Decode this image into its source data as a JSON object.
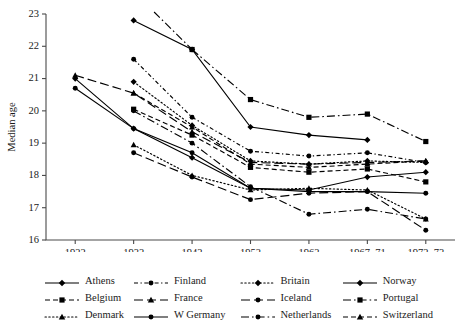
{
  "chart_data": {
    "type": "line",
    "title": "",
    "xlabel": "Birth cohort",
    "ylabel": "Median age",
    "categories": [
      "1922",
      "1932",
      "1942",
      "1952",
      "1962",
      "1967–71",
      "1972–73"
    ],
    "ylim": [
      16,
      23
    ],
    "yticks": [
      16,
      17,
      18,
      19,
      20,
      21,
      22,
      23
    ],
    "grid": false,
    "legend_position": "below",
    "legend_columns": 4,
    "series": [
      {
        "name": "Athens",
        "marker": "diamond",
        "dash": "solid",
        "values": [
          null,
          22.8,
          21.9,
          19.5,
          19.25,
          19.1,
          null
        ]
      },
      {
        "name": "Finland",
        "marker": "circle",
        "dash": "dash-dot-fine",
        "values": [
          null,
          21.6,
          19.8,
          18.75,
          18.6,
          18.7,
          18.4
        ]
      },
      {
        "name": "Britain",
        "marker": "diamond",
        "dash": "dotted",
        "values": [
          null,
          20.9,
          19.55,
          18.45,
          18.35,
          18.45,
          18.4
        ]
      },
      {
        "name": "Norway",
        "marker": "diamond",
        "dash": "solid",
        "values": [
          21.0,
          19.45,
          18.55,
          17.6,
          17.55,
          17.95,
          18.1
        ]
      },
      {
        "name": "Belgium",
        "marker": "square",
        "dash": "dashed",
        "values": [
          null,
          20.05,
          19.25,
          18.25,
          18.1,
          18.2,
          17.8
        ]
      },
      {
        "name": "France",
        "marker": "triangle",
        "dash": "long-dash",
        "values": [
          21.1,
          20.55,
          19.35,
          18.4,
          18.35,
          18.4,
          18.45
        ]
      },
      {
        "name": "Iceland",
        "marker": "circle",
        "dash": "long-dash",
        "values": [
          null,
          18.7,
          17.95,
          17.25,
          17.45,
          17.5,
          16.3
        ]
      },
      {
        "name": "Portugal",
        "marker": "square",
        "dash": "dash-dot",
        "values": [
          null,
          null,
          21.9,
          20.35,
          19.8,
          19.9,
          19.05
        ]
      },
      {
        "name": "Denmark",
        "marker": "triangle",
        "dash": "dotted",
        "values": [
          null,
          18.95,
          18.0,
          17.55,
          17.6,
          17.55,
          16.65
        ]
      },
      {
        "name": "W Germany",
        "marker": "circle",
        "dash": "solid",
        "values": [
          20.7,
          19.45,
          18.7,
          17.6,
          17.5,
          17.5,
          17.45
        ]
      },
      {
        "name": "Netherlands",
        "marker": "circle",
        "dash": "dash-dot",
        "values": [
          null,
          20.0,
          19.0,
          17.65,
          16.8,
          16.95,
          16.65
        ]
      },
      {
        "name": "Switzerland",
        "marker": "triangle",
        "dash": "dashed",
        "values": [
          null,
          20.55,
          19.5,
          18.35,
          18.25,
          18.35,
          18.45
        ]
      }
    ]
  },
  "legend": {
    "rows": [
      [
        {
          "label": "Athens",
          "series": 0
        },
        {
          "label": "Finland",
          "series": 1
        },
        {
          "label": "Britain",
          "series": 2
        },
        {
          "label": "Norway",
          "series": 3
        }
      ],
      [
        {
          "label": "Belgium",
          "series": 4
        },
        {
          "label": "France",
          "series": 5
        },
        {
          "label": "Iceland",
          "series": 6
        },
        {
          "label": "Portugal",
          "series": 7
        }
      ],
      [
        {
          "label": "Denmark",
          "series": 8
        },
        {
          "label": "W Germany",
          "series": 9
        },
        {
          "label": "Netherlands",
          "series": 10
        },
        {
          "label": "Switzerland",
          "series": 11
        }
      ]
    ]
  },
  "colors": {
    "ink": "#000000",
    "axis": "#4a4a4a",
    "background": "#ffffff"
  }
}
